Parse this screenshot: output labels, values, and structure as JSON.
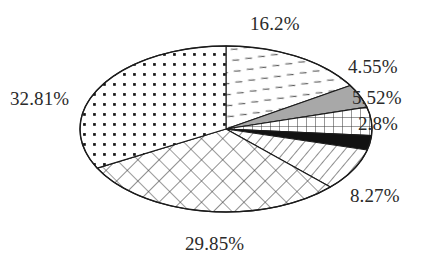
{
  "chart_data": {
    "type": "pie",
    "title": "",
    "subtitle": "",
    "xlabel": "",
    "ylabel": "",
    "legend": "none",
    "grid": false,
    "value_unit": "percent",
    "label_format": "{value}%",
    "categories": [
      "slice-16-2",
      "slice-4-55",
      "slice-5-52",
      "slice-2-8",
      "slice-8-27",
      "slice-29-85",
      "slice-32-81"
    ],
    "values": [
      16.2,
      4.55,
      5.52,
      2.8,
      8.27,
      29.85,
      32.81
    ],
    "labels": [
      "16.2%",
      "4.55%",
      "5.52%",
      "2.8%",
      "8.27%",
      "29.85%",
      "32.81%"
    ],
    "total": 100.0,
    "start_angle_deg": -90,
    "direction": "clockwise",
    "slices": [
      {
        "label": "16.2%",
        "value": 16.2,
        "fill_pattern": "sparse-dashes",
        "fill_color": "#ffffff",
        "pattern_color": "#4d4d4d",
        "position": "top-right"
      },
      {
        "label": "4.55%",
        "value": 4.55,
        "fill_pattern": "solid-gray",
        "fill_color": "#a8a8a8",
        "pattern_color": "#a8a8a8",
        "position": "right-upper"
      },
      {
        "label": "5.52%",
        "value": 5.52,
        "fill_pattern": "square-grid",
        "fill_color": "#ffffff",
        "pattern_color": "#3a3a3a",
        "position": "right"
      },
      {
        "label": "2.8%",
        "value": 2.8,
        "fill_pattern": "solid-black",
        "fill_color": "#101010",
        "pattern_color": "#101010",
        "position": "right-lower"
      },
      {
        "label": "8.27%",
        "value": 8.27,
        "fill_pattern": "diagonal-lines",
        "fill_color": "#ffffff",
        "pattern_color": "#3a3a3a",
        "position": "bottom-right"
      },
      {
        "label": "29.85%",
        "value": 29.85,
        "fill_pattern": "diamond-crosshatch",
        "fill_color": "#ffffff",
        "pattern_color": "#3a3a3a",
        "position": "bottom"
      },
      {
        "label": "32.81%",
        "value": 32.81,
        "fill_pattern": "dot-grid",
        "fill_color": "#ffffff",
        "pattern_color": "#1a1a1a",
        "position": "left"
      }
    ],
    "geometry": {
      "center_x": 226,
      "center_y": 129,
      "radius_x": 146,
      "radius_y": 83
    },
    "colors": {
      "outline": "#1b1b1b",
      "background": "#ffffff",
      "label_text": "#2a2a2a",
      "gray_slice": "#a8a8a8",
      "black_slice": "#101010"
    }
  }
}
